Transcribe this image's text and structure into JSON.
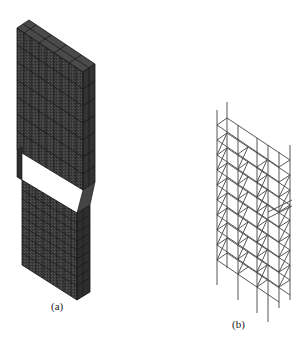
{
  "figure": {
    "panels": [
      {
        "id": "a",
        "label": "(a)",
        "description": "Solid finite element mesh model of stepped wall/column",
        "label_pos": [
          51,
          300
        ],
        "fill_color": "#3a3a3a",
        "grid_color": "#151515"
      },
      {
        "id": "b",
        "label": "(b)",
        "description": "Frame/reinforcement skeleton model",
        "label_pos": [
          232,
          318
        ],
        "stroke_color": "#444444"
      }
    ]
  }
}
